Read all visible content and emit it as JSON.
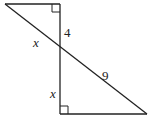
{
  "diagram": {
    "type": "geometry",
    "labels": {
      "top_vertical_segment": "4",
      "upper_hypotenuse_segment": "x",
      "lower_hypotenuse_segment": "9",
      "bottom_vertical_segment": "x"
    },
    "right_angles": [
      "top-corner",
      "bottom-corner"
    ],
    "stroke_color": "#222222"
  }
}
